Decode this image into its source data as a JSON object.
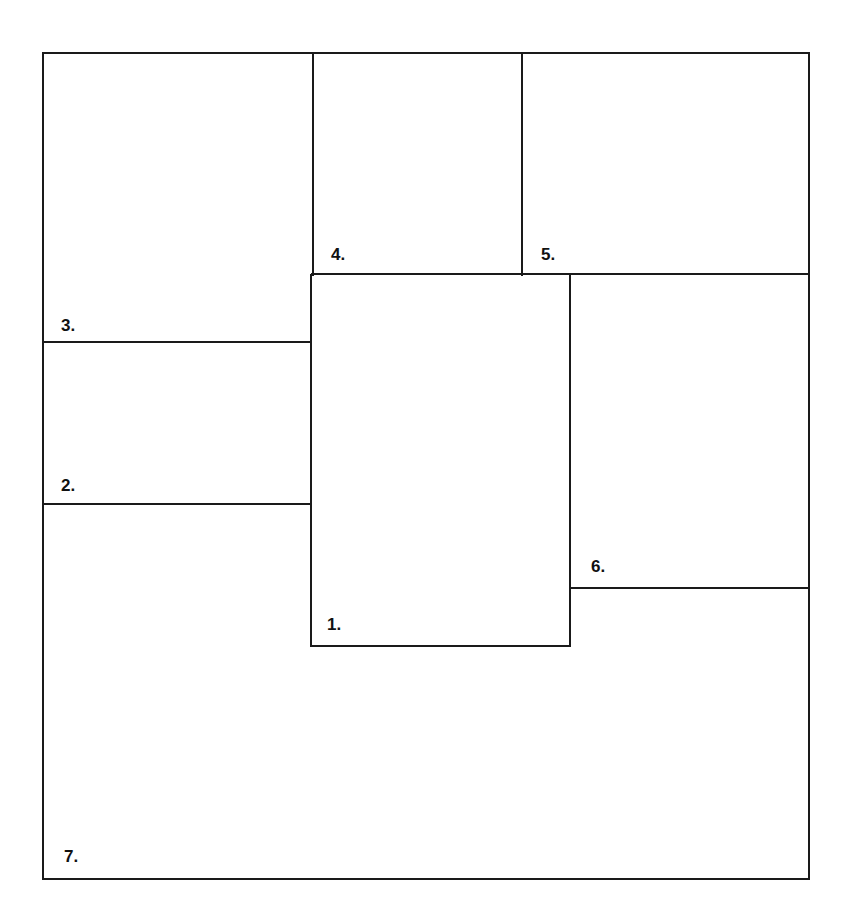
{
  "diagram": {
    "type": "panel-layout",
    "line_color": "#1a1a1a",
    "background": "#ffffff",
    "panels": [
      {
        "id": 1,
        "label": "1."
      },
      {
        "id": 2,
        "label": "2."
      },
      {
        "id": 3,
        "label": "3."
      },
      {
        "id": 4,
        "label": "4."
      },
      {
        "id": 5,
        "label": "5."
      },
      {
        "id": 6,
        "label": "6."
      },
      {
        "id": 7,
        "label": "7."
      }
    ]
  }
}
